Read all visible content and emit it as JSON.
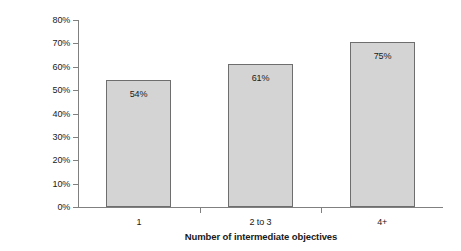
{
  "chart_data": {
    "type": "bar",
    "title": "",
    "xlabel": "Number of intermediate objectives",
    "ylabel": "Effectiveness success rate",
    "categories": [
      "1",
      "2 to 3",
      "4+"
    ],
    "values": [
      54,
      61,
      75
    ],
    "value_labels": [
      "54%",
      "61%",
      "75%"
    ],
    "ylim": [
      0,
      80
    ],
    "ytick_values": [
      0,
      10,
      20,
      30,
      40,
      50,
      60,
      70,
      80
    ],
    "ytick_labels": [
      "0%",
      "10%",
      "20%",
      "30%",
      "40%",
      "50%",
      "60%",
      "70%",
      "80%"
    ],
    "unit": "%",
    "grid": false,
    "legend": false,
    "legend_position": "none",
    "series": [
      {
        "name": "Effectiveness success rate",
        "values": [
          54,
          61,
          75
        ]
      }
    ],
    "bar_fill_color": "#d4d4d4",
    "bar_border_color": "#6e6e6e",
    "axis_color": "#808080",
    "background_color": "#ffffff",
    "text_color": "#1a1a1a",
    "bar_drawn_tops": [
      54.5,
      61.3,
      70.7
    ]
  }
}
